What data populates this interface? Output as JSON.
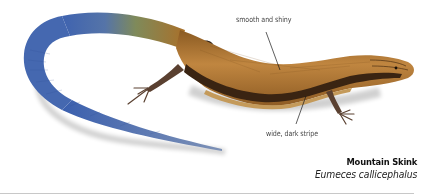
{
  "figure": {
    "colors": {
      "body": "#a9702a",
      "body_highlight": "#c98d45",
      "stripe": "#3a2412",
      "tail_start": "#7f8a5a",
      "tail_end": "#3f63b0",
      "legs": "#5a4030",
      "divider": "#c8c8c8"
    }
  },
  "callouts": [
    {
      "label": "smooth and shiny"
    },
    {
      "label": "wide, dark stripe"
    }
  ],
  "caption": {
    "common_name": "Mountain Skink",
    "scientific_name": "Eumeces callicephalus"
  }
}
